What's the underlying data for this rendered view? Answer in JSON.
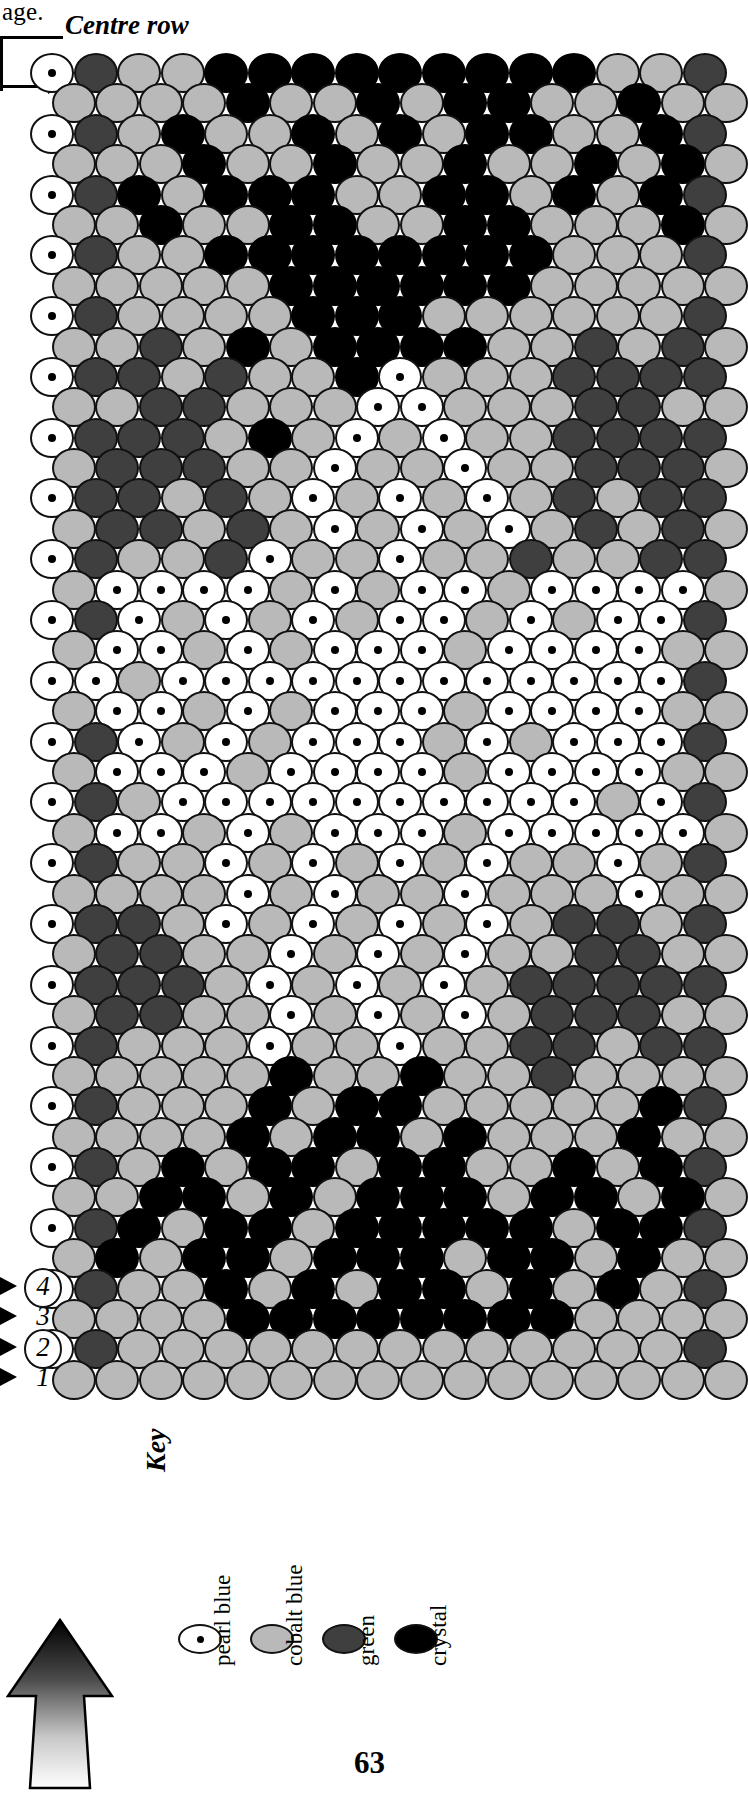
{
  "page": {
    "top_text": "age.",
    "page_number": "63"
  },
  "chart_labels": {
    "centre_row": "Centre row",
    "row_numbers": [
      "1",
      "2",
      "3",
      "4"
    ]
  },
  "key": {
    "title": "Key",
    "items": [
      {
        "label": "pearl blue",
        "swatch": "pearl",
        "color": "#ffffff"
      },
      {
        "label": "cobalt blue",
        "swatch": "cobalt",
        "color": "#b9b9b9"
      },
      {
        "label": "green",
        "swatch": "green",
        "color": "#3f3f3f"
      },
      {
        "label": "crystal",
        "swatch": "crystal",
        "color": "#000000"
      }
    ]
  },
  "icons": {
    "direction_arrow": "up-arrow-icon",
    "row_marker": "triangle-pointer-icon"
  },
  "chart_data": {
    "type": "heatmap",
    "palette": {
      "P": "pearl blue",
      "C": "cobalt blue",
      "G": "green",
      "K": "crystal"
    },
    "columns": 16,
    "rows": 44,
    "note": "Odd-indexed rows are offset by half a bead (peyote stitch). Row 1 is the bottom row; the top row is the centre row.",
    "grid": [
      "PGCCKKKKKKKKKCCG",
      "CCCCKCCKCKKCCKCC",
      "PGCKCCKCKCKKCCKG",
      "CCCKCCKCCKCCKCKC",
      "PGKCKKKCCKKCKCKG",
      "CCKCCKKCCKKCCCKC",
      "PGCCKKKKKKKKCCCG",
      "CCCCCKKKKKKCCCCC",
      "PGCCCCKKKCCCCCCG",
      "CCGCKCKKKKCCGCGC",
      "PGGCGCCKPCCCGGGG",
      "CCGGCCCPPCCCGGCC",
      "PGGGCKCPCPCCGGGG",
      "CGGGCCPCCPCCGGGC",
      "PGGCGCPCPCPCGCGG",
      "CGGCGCPCPCPCGCGC",
      "PGCCGPCCPCCGCCGG",
      "CPPPPCPCPPCPPPPC",
      "PGPCPCPCPPCPCPPG",
      "CPPCPCPPPCPPPPCC",
      "PPCPPPPPPPPPPPPG",
      "CPPCPCPPPCPPPPCC",
      "PGPCPCPPPCPCPPPG",
      "CPPPCPPPPCPPPPCC",
      "PGCPPPPPPPPPPCPG",
      "CPPCPCPPPCPPPPPC",
      "PGCCPCPCPCPCCPCG",
      "CCCCPCPCCPCCCPCC",
      "PGGCPCPCPCPCGGCG",
      "CGGCCPCPCPCCGGCC",
      "PGGGCPCPCPCGGGGG",
      "CGGCCPCPCPCGGGCC",
      "PGCCCPCCPCCGGCGG",
      "CCCCCKCCKCCGCCCC",
      "PGCCCKCKKCCCCCKG",
      "CCCCKCKKCKCCCKCC",
      "PGCKCKKCKKCCKCKG",
      "CCKKCKCKKKCKKCKC",
      "PGKCKKCKKKKKCKKG",
      "CKCKKCKKKCKKCKCC",
      "PGCCKCKCKKCKCKCG",
      "CCCCKKKKKKKKCCCC",
      "PGCCCCCCCCCCCCCG",
      "CCCCCCCCCCCCCCCC"
    ]
  }
}
